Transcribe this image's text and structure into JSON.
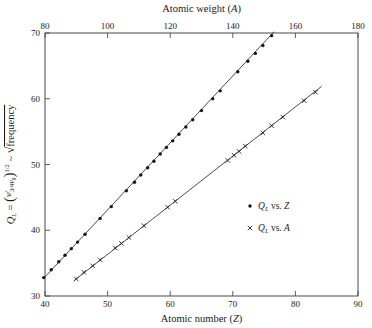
{
  "chart_data": {
    "type": "scatter",
    "title": "",
    "xlabel": "Atomic number (Z)",
    "ylabel": "Q_L = (v / (3/4 v0))^(1/2) ~ sqrt(frequency)",
    "xlabel_top": "Atomic weight (A)",
    "xlim": [
      40,
      90
    ],
    "ylim": [
      30,
      70
    ],
    "xlim_top": [
      80,
      180
    ],
    "grid": false,
    "legend_position": "center-right",
    "xticks": [
      40,
      50,
      60,
      70,
      80,
      90
    ],
    "yticks": [
      30,
      40,
      50,
      60,
      70
    ],
    "xticks_top": [
      80,
      100,
      120,
      140,
      160,
      180
    ],
    "series": [
      {
        "name": "QL vs. Z",
        "marker": "dot",
        "x_axis": "atomic_number",
        "fit_line": {
          "x_start": 39.8,
          "y_start": 32.7,
          "x_end": 76.6,
          "y_end": 70.2
        },
        "points": [
          {
            "x": 39.8,
            "y": 32.8
          },
          {
            "x": 41.0,
            "y": 34.0
          },
          {
            "x": 42.2,
            "y": 35.2
          },
          {
            "x": 43.2,
            "y": 36.2
          },
          {
            "x": 44.2,
            "y": 37.2
          },
          {
            "x": 45.2,
            "y": 38.2
          },
          {
            "x": 46.4,
            "y": 39.4
          },
          {
            "x": 48.8,
            "y": 41.8
          },
          {
            "x": 50.6,
            "y": 43.6
          },
          {
            "x": 53.0,
            "y": 46.0
          },
          {
            "x": 54.3,
            "y": 47.3
          },
          {
            "x": 55.3,
            "y": 48.4
          },
          {
            "x": 56.4,
            "y": 49.5
          },
          {
            "x": 57.4,
            "y": 50.5
          },
          {
            "x": 58.4,
            "y": 51.6
          },
          {
            "x": 59.4,
            "y": 52.6
          },
          {
            "x": 60.4,
            "y": 53.6
          },
          {
            "x": 61.4,
            "y": 54.6
          },
          {
            "x": 62.5,
            "y": 55.7
          },
          {
            "x": 63.6,
            "y": 56.8
          },
          {
            "x": 65.0,
            "y": 58.2
          },
          {
            "x": 66.8,
            "y": 60.0
          },
          {
            "x": 68.0,
            "y": 61.2
          },
          {
            "x": 70.8,
            "y": 64.1
          },
          {
            "x": 72.4,
            "y": 65.7
          },
          {
            "x": 73.6,
            "y": 66.9
          },
          {
            "x": 74.8,
            "y": 68.1
          },
          {
            "x": 76.2,
            "y": 69.6
          }
        ]
      },
      {
        "name": "QL vs. A",
        "marker": "x",
        "x_axis": "atomic_weight",
        "fit_line": {
          "x_start": 44.6,
          "y_start": 32.3,
          "x_end": 84.2,
          "y_end": 61.9
        },
        "points": [
          {
            "x": 45.0,
            "y": 32.6
          },
          {
            "x": 46.2,
            "y": 33.6
          },
          {
            "x": 47.6,
            "y": 34.6
          },
          {
            "x": 48.8,
            "y": 35.5
          },
          {
            "x": 51.2,
            "y": 37.3
          },
          {
            "x": 52.2,
            "y": 38.0
          },
          {
            "x": 53.4,
            "y": 38.9
          },
          {
            "x": 55.8,
            "y": 40.7
          },
          {
            "x": 59.6,
            "y": 43.5
          },
          {
            "x": 60.8,
            "y": 44.4
          },
          {
            "x": 69.2,
            "y": 50.6
          },
          {
            "x": 70.2,
            "y": 51.4
          },
          {
            "x": 71.0,
            "y": 52.0
          },
          {
            "x": 72.0,
            "y": 52.8
          },
          {
            "x": 74.8,
            "y": 54.8
          },
          {
            "x": 76.2,
            "y": 55.9
          },
          {
            "x": 78.0,
            "y": 57.2
          },
          {
            "x": 81.4,
            "y": 59.7
          },
          {
            "x": 83.2,
            "y": 61.0
          }
        ]
      }
    ],
    "legend": [
      {
        "marker": "dot",
        "text": "vs.",
        "symbol": "Q",
        "sub": "L",
        "variable": "Z"
      },
      {
        "marker": "x",
        "text": "vs.",
        "symbol": "Q",
        "sub": "L",
        "variable": "A"
      }
    ]
  },
  "labels": {
    "top_axis_title_main": "Atomic weight",
    "top_axis_title_var": "A",
    "bottom_axis_title_main": "Atomic number",
    "bottom_axis_title_var": "Z",
    "y_axis_symbol": "Q",
    "y_axis_sub": "L",
    "y_axis_eq": "=",
    "y_axis_numerator": "v",
    "y_axis_denom_frac": "3",
    "y_axis_denom_frac2": "4",
    "y_axis_denom_sym": "v",
    "y_axis_denom_sub": "0",
    "y_axis_exp": "1/2",
    "y_axis_tilde": "~",
    "y_axis_sqrt_word": "frequency",
    "legend_vs": "vs.",
    "legend_Q": "Q",
    "legend_sub": "L",
    "legend_z": "Z",
    "legend_a": "A",
    "paren_open": "(",
    "paren_close": ")"
  },
  "colors": {
    "frame": "#4a4a4a",
    "line": "#2b2b2b",
    "marker": "#161616",
    "background": "#ffffff",
    "text": "#1a1a1a"
  }
}
